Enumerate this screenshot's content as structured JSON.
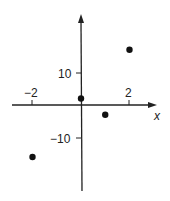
{
  "chart_data": {
    "type": "scatter",
    "title": "",
    "xlabel": "x",
    "ylabel": "",
    "x_ticks": [
      -2,
      2
    ],
    "x_tick_labels": [
      "−2",
      "2"
    ],
    "y_ticks": [
      10,
      -10
    ],
    "y_tick_labels": [
      "10",
      "−10"
    ],
    "points": [
      {
        "x": -2,
        "y": -16
      },
      {
        "x": 0,
        "y": 2
      },
      {
        "x": 1,
        "y": -3
      },
      {
        "x": 2,
        "y": 17
      }
    ],
    "xlim": [
      -3.3,
      3.6
    ],
    "ylim": [
      -21,
      22
    ],
    "grid": false,
    "legend": null
  },
  "labels": {
    "x_axis": "x",
    "tick_x_neg2": "−2",
    "tick_x_2": "2",
    "tick_y_10": "10",
    "tick_y_neg10": "−10"
  }
}
